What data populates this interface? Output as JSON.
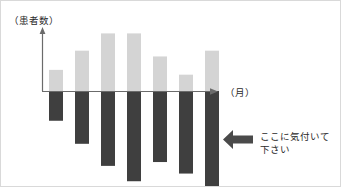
{
  "figure": {
    "title": "",
    "y_axis_label": "（患者数）",
    "x_axis_label": "（月）",
    "annotation_text": "ここに気付いて\n下さい",
    "annotation_arrow_icon": "arrow-left-icon",
    "colors": {
      "positive_bar": "#d4d4d4",
      "negative_bar": "#3f3f3f",
      "axis": "#6b6b6b",
      "text": "#2b2b2b",
      "annotation_arrow": "#4a4a4a",
      "frame_border": "#d9d9d9",
      "background": "#ffffff"
    }
  },
  "chart_data": {
    "type": "bar",
    "title": "",
    "xlabel": "（月）",
    "ylabel": "（患者数）",
    "grid": false,
    "legend": false,
    "axis_arrows": true,
    "baseline": 0,
    "categories": [
      "1",
      "2",
      "3",
      "4",
      "5",
      "6",
      "7"
    ],
    "ylim": [
      -10,
      6
    ],
    "series": [
      {
        "name": "（患者数）上側",
        "color": "#d4d4d4",
        "values": [
          2.2,
          4.2,
          6.0,
          6.0,
          3.6,
          1.7,
          4.2
        ]
      },
      {
        "name": "（患者数）下側",
        "color": "#3f3f3f",
        "values": [
          -3.1,
          -5.5,
          -7.8,
          -9.4,
          -7.4,
          -8.6,
          -10.0
        ]
      }
    ],
    "annotations": [
      {
        "text": "ここに気付いて下さい",
        "arrow": "left",
        "x": 7,
        "y": -6
      }
    ]
  }
}
